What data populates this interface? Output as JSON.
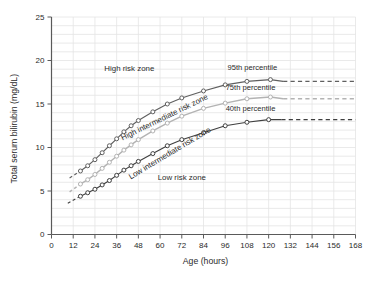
{
  "page": {
    "background": "#ffffff"
  },
  "chart_data": {
    "type": "line",
    "title": "",
    "xlabel": "Age (hours)",
    "ylabel": "Total serum bilirubin (mg/dL)",
    "xlim": [
      0,
      168
    ],
    "ylim": [
      0,
      25
    ],
    "xticks": [
      0,
      12,
      24,
      36,
      48,
      60,
      72,
      84,
      96,
      108,
      120,
      132,
      144,
      156,
      168
    ],
    "yticks": [
      0,
      5,
      10,
      15,
      20,
      25
    ],
    "grid": {
      "on": true,
      "vertical_step_hours": 12,
      "horizontal_step_mgdl": 1,
      "color": "#e4e4e4"
    },
    "axis_color": "#5a5a5a",
    "text_color": "#2b2b2b",
    "legend_position": "none",
    "series": [
      {
        "name": "95th percentile",
        "color": "#5f5f5f",
        "marker": "open-circle",
        "line_width": 1.1,
        "dashed_lead": {
          "x": [
            10,
            16
          ],
          "y": [
            6.5,
            7.3
          ]
        },
        "x": [
          16,
          20,
          24,
          28,
          32,
          36,
          40,
          44,
          48,
          56,
          64,
          72,
          84,
          96,
          108,
          121
        ],
        "y": [
          7.3,
          7.9,
          8.6,
          9.4,
          10.2,
          11.0,
          11.8,
          12.5,
          13.1,
          14.1,
          15.0,
          15.7,
          16.5,
          17.2,
          17.6,
          17.8
        ],
        "dashed_tail": {
          "x": [
            128,
            168
          ],
          "y": [
            17.6,
            17.6
          ]
        },
        "label": {
          "text": "95th percentile",
          "x": 111,
          "y": 18.9,
          "rotation": 0
        }
      },
      {
        "name": "75th percentile",
        "color": "#b3b3b3",
        "marker": "open-circle",
        "line_width": 1.4,
        "dashed_lead": {
          "x": [
            10,
            16
          ],
          "y": [
            4.9,
            5.8
          ]
        },
        "x": [
          16,
          20,
          24,
          28,
          32,
          36,
          40,
          44,
          48,
          56,
          64,
          72,
          84,
          96,
          108,
          121
        ],
        "y": [
          5.8,
          6.3,
          6.9,
          7.6,
          8.3,
          9.0,
          9.7,
          10.3,
          10.9,
          11.9,
          12.8,
          13.6,
          14.5,
          15.1,
          15.6,
          15.8
        ],
        "dashed_tail": {
          "x": [
            128,
            168
          ],
          "y": [
            15.6,
            15.6
          ]
        },
        "label": {
          "text": "75th percentile",
          "x": 110,
          "y": 16.6,
          "rotation": 0
        }
      },
      {
        "name": "40th percentile",
        "color": "#3f3f3f",
        "marker": "open-circle",
        "line_width": 1.1,
        "dashed_lead": {
          "x": [
            9,
            16
          ],
          "y": [
            3.6,
            4.4
          ]
        },
        "x": [
          16,
          20,
          24,
          28,
          32,
          36,
          40,
          44,
          48,
          56,
          64,
          72,
          84,
          96,
          108,
          120
        ],
        "y": [
          4.4,
          4.8,
          5.2,
          5.7,
          6.2,
          6.8,
          7.4,
          7.9,
          8.4,
          9.3,
          10.2,
          10.9,
          11.7,
          12.5,
          12.9,
          13.2
        ],
        "dashed_tail": {
          "x": [
            127,
            168
          ],
          "y": [
            13.2,
            13.2
          ]
        },
        "label": {
          "text": "40th percentile",
          "x": 110,
          "y": 14.2,
          "rotation": 0
        }
      }
    ],
    "zones": [
      {
        "id": "high-risk",
        "text": "High risk zone",
        "x": 43,
        "y": 18.8,
        "rotation": 0
      },
      {
        "id": "high-intermediate-risk",
        "text": "High intermediate risk zone",
        "x": 63,
        "y": 13.2,
        "rotation": -26
      },
      {
        "id": "low-intermediate-risk",
        "text": "Low intermediate risk zone",
        "x": 66,
        "y": 9.1,
        "rotation": -31
      },
      {
        "id": "low-risk",
        "text": "Low risk zone",
        "x": 72,
        "y": 6.3,
        "rotation": 0
      }
    ]
  }
}
